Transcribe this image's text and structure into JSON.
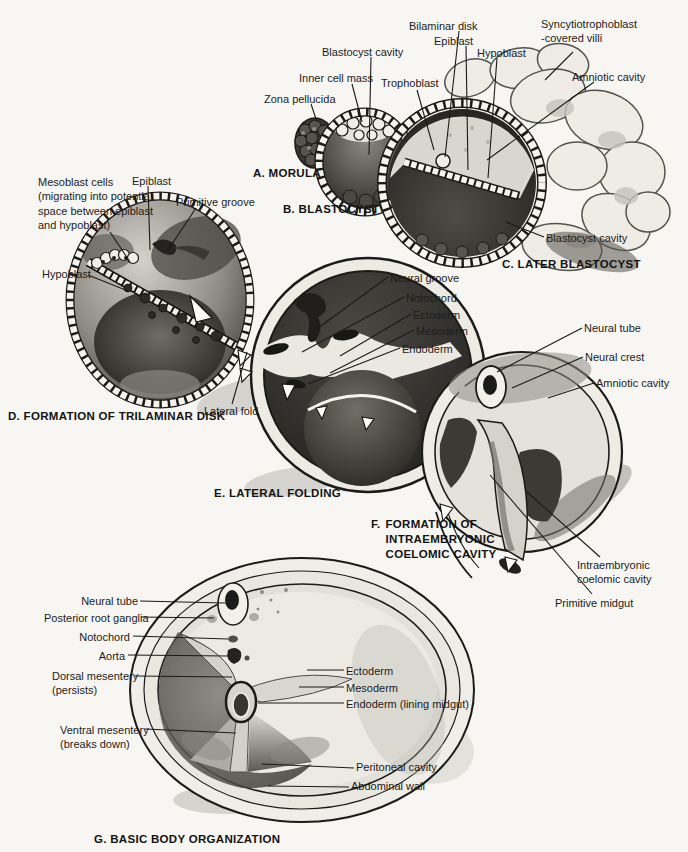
{
  "page": {
    "paper_color": "#f7f6f2",
    "ink_color": "#1c1c1a"
  },
  "panels": {
    "a": {
      "caption": "A. MORULA",
      "labels": {
        "zona_pellucida": "Zona pellucida"
      }
    },
    "b": {
      "caption": "B. BLASTOCYST",
      "labels": {
        "blastocyst_cavity": "Blastocyst cavity",
        "inner_cell_mass": "Inner cell mass",
        "trophoblast": "Trophoblast"
      }
    },
    "c": {
      "caption": "C. LATER BLASTOCYST",
      "labels": {
        "bilaminar_disk": "Bilaminar disk",
        "epiblast": "Epiblast",
        "hypoblast": "Hypoblast",
        "syncytiotrophoblast_villi": "Syncytiotrophoblast\n-covered villi",
        "amniotic_cavity": "Amniotic cavity",
        "blastocyst_cavity": "Blastocyst cavity"
      }
    },
    "d": {
      "caption": "D. FORMATION OF TRILAMINAR DISK",
      "labels": {
        "mesoblast_cells": "Mesoblast cells\n(migrating into potential\nspace between epiblast\nand hypoblast)",
        "epiblast": "Epiblast",
        "primitive_groove": "Primitive groove",
        "hypoblast": "Hypoblast"
      }
    },
    "e": {
      "caption": "E. LATERAL FOLDING",
      "labels": {
        "neural_groove": "Neural groove",
        "notochord": "Notochord",
        "ectoderm": "Ectoderm",
        "mesoderm": "Mesoderm",
        "endoderm": "Endoderm",
        "lateral_fold": "Lateral fold"
      }
    },
    "f": {
      "caption_prefix": "F.",
      "caption_body": "FORMATION OF\nINTRAEMBRYONIC\nCOELOMIC CAVITY",
      "labels": {
        "neural_tube": "Neural tube",
        "neural_crest": "Neural crest",
        "amniotic_cavity": "Amniotic cavity",
        "intraembryonic_coelomic_cavity": "Intraembryonic\ncoelomic cavity",
        "primitive_midgut": "Primitive midgut"
      }
    },
    "g": {
      "caption": "G. BASIC BODY ORGANIZATION",
      "labels": {
        "neural_tube": "Neural tube",
        "posterior_root_ganglia": "Posterior root ganglia",
        "notochord": "Notochord",
        "aorta": "Aorta",
        "dorsal_mesentery": "Dorsal mesentery\n(persists)",
        "ventral_mesentery": "Ventral mesentery\n(breaks down)",
        "ectoderm": "Ectoderm",
        "mesoderm": "Mesoderm",
        "endoderm_lining_midgut": "Endoderm (lining midgut)",
        "peritoneal_cavity": "Peritoneal cavity",
        "abdominal_wall": "Abdominal wall"
      }
    }
  }
}
